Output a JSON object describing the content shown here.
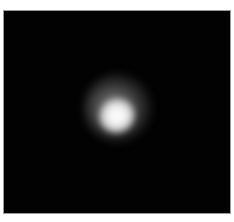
{
  "image": {
    "description": "Grayscale image of a blurred bright spot on a black background",
    "background_color": "#020202",
    "border_color": "#9a9a9a",
    "spot_color": "#ffffff"
  }
}
